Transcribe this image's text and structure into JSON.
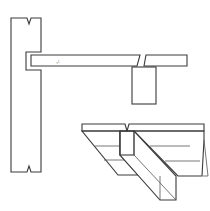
{
  "figure": {
    "type": "technical-drawing",
    "colors": {
      "line": "#3a3a3a",
      "background": "#ffffff",
      "hatch": "#4a4a4a"
    },
    "parts": [
      {
        "name": "wall-section",
        "hatched": true
      },
      {
        "name": "slab-section-left",
        "hatched": true
      },
      {
        "name": "slab-section-right",
        "hatched": true
      },
      {
        "name": "beam-section",
        "hatched": true
      },
      {
        "name": "isometric-slab-beam",
        "hatched": true
      }
    ]
  }
}
